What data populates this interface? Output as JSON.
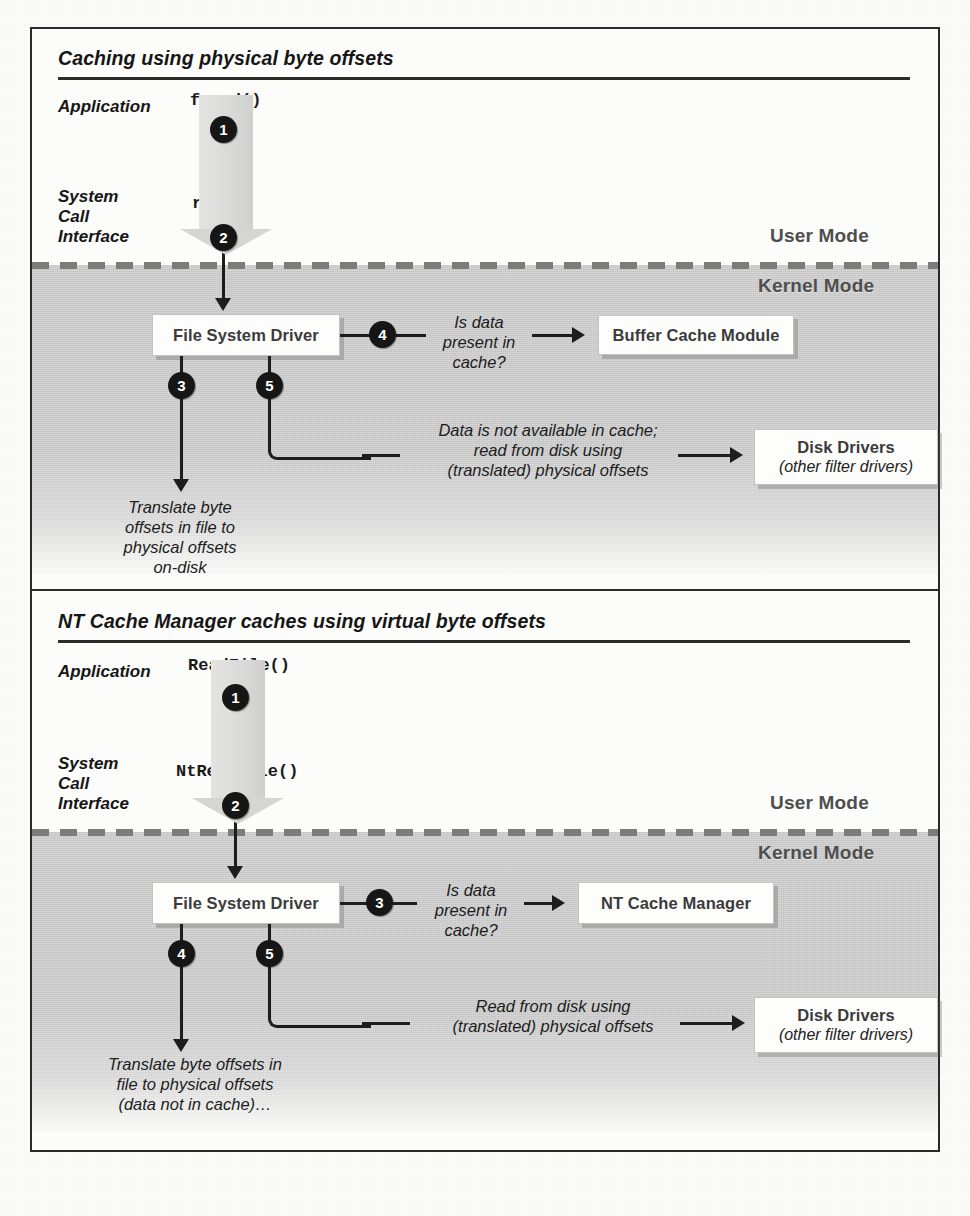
{
  "figure": {
    "panels": [
      {
        "id": "physical-offsets",
        "title": "Caching using physical byte offsets",
        "mode_labels": {
          "user": "User Mode",
          "kernel": "Kernel Mode"
        },
        "layer_labels": {
          "application": "Application",
          "syscall": "System\nCall\nInterface"
        },
        "calls": {
          "user_api": "fread()",
          "system_call": "read()"
        },
        "boxes": [
          {
            "name": "file-system-driver",
            "title": "File System Driver",
            "subtitle": ""
          },
          {
            "name": "cache-module",
            "title": "Buffer Cache Module",
            "subtitle": ""
          },
          {
            "name": "disk-drivers",
            "title": "Disk Drivers",
            "subtitle": "(other filter drivers)"
          }
        ],
        "steps": [
          "1",
          "2",
          "3",
          "4",
          "5"
        ],
        "annotations": {
          "cache_query": "Is data\npresent in\ncache?",
          "disk_read": "Data is not available in cache;\nread from disk using\n(translated) physical offsets",
          "translate": "Translate byte\noffsets in file to\nphysical offsets\non-disk"
        }
      },
      {
        "id": "virtual-offsets",
        "title": "NT Cache Manager caches using virtual byte offsets",
        "mode_labels": {
          "user": "User Mode",
          "kernel": "Kernel Mode"
        },
        "layer_labels": {
          "application": "Application",
          "syscall": "System\nCall\nInterface"
        },
        "calls": {
          "user_api": "ReadFile()",
          "system_call": "NtReadFile()"
        },
        "boxes": [
          {
            "name": "file-system-driver",
            "title": "File System Driver",
            "subtitle": ""
          },
          {
            "name": "cache-module",
            "title": "NT Cache Manager",
            "subtitle": ""
          },
          {
            "name": "disk-drivers",
            "title": "Disk Drivers",
            "subtitle": "(other filter drivers)"
          }
        ],
        "steps": [
          "1",
          "2",
          "3",
          "4",
          "5"
        ],
        "annotations": {
          "cache_query": "Is data\npresent in\ncache?",
          "disk_read": "Read from disk using\n(translated) physical offsets",
          "translate": "Translate byte offsets in\nfile to physical offsets\n(data not in cache)…"
        }
      }
    ],
    "colors": {
      "kernel_shade": "#c9c9c9",
      "badge_fill": "#161616",
      "frame_stroke": "#2a2a2a",
      "mode_label": "#4e4e4e",
      "box_title": "#3b3b3b"
    }
  }
}
